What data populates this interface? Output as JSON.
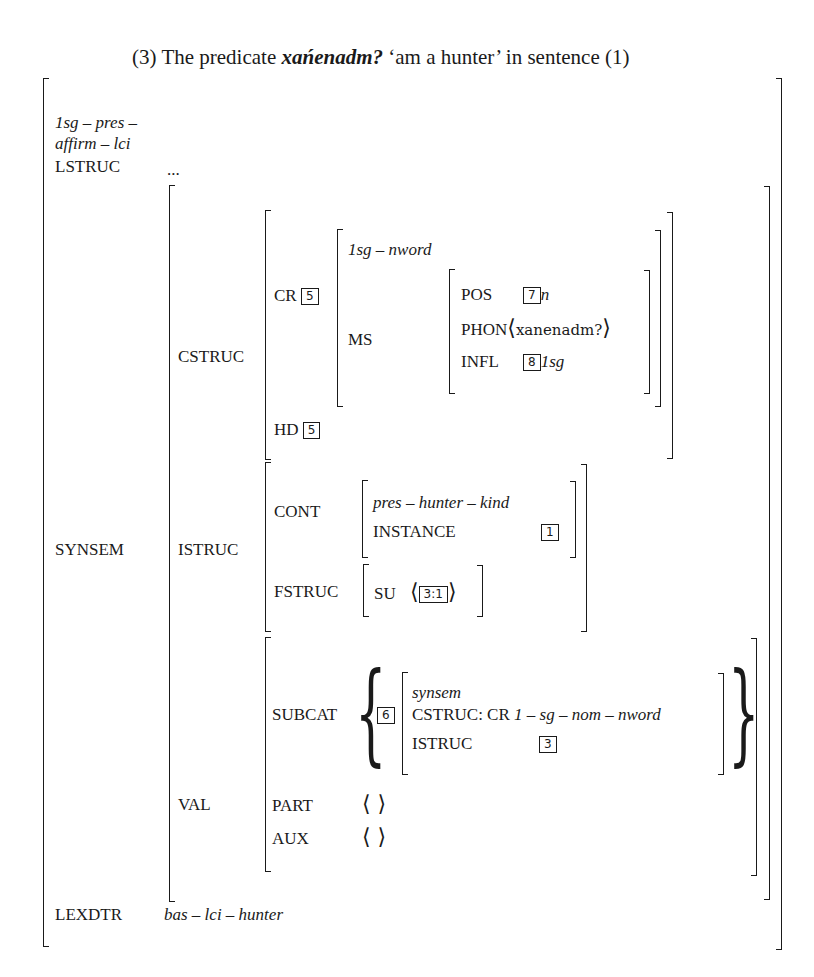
{
  "caption": {
    "number": "(3)",
    "prefix": "The predicate",
    "word": "xańenadm?",
    "gloss": "‘am a hunter’",
    "suffix": "in sentence (1)"
  },
  "avm": {
    "type_line1": "1sg – pres –",
    "type_line2": "affirm – lci",
    "lstruc": {
      "label": "LSTRUC",
      "value": "..."
    },
    "synsem": {
      "label": "SYNSEM",
      "cstruc": {
        "label": "CSTRUC",
        "cr": {
          "label": "CR",
          "tag": "5",
          "type": "1sg – nword",
          "ms": {
            "label": "MS",
            "pos": {
              "label": "POS",
              "tag": "7",
              "value": "n"
            },
            "phon": {
              "label": "PHON",
              "value": "xanenadm?"
            },
            "infl": {
              "label": "INFL",
              "tag": "8",
              "value": "1sg"
            }
          }
        },
        "hd": {
          "label": "HD",
          "tag": "5"
        }
      },
      "istruc": {
        "label": "ISTRUC",
        "cont": {
          "label": "CONT",
          "type": "pres – hunter – kind",
          "instance_label": "INSTANCE",
          "instance_tag": "1"
        },
        "fstruc": {
          "label": "FSTRUC",
          "su_label": "SU",
          "su_tag": "3:1"
        }
      },
      "val": {
        "label": "VAL",
        "subcat": {
          "label": "SUBCAT",
          "tag": "6",
          "type": "synsem",
          "cstruc_label": "CSTRUC: CR",
          "cstruc_value": "1 – sg – nom – nword",
          "istruc_label": "ISTRUC",
          "istruc_tag": "3"
        },
        "part": {
          "label": "PART",
          "value": "⟨ ⟩"
        },
        "aux": {
          "label": "AUX",
          "value": "⟨ ⟩"
        }
      }
    },
    "lexdtr": {
      "label": "LEXDTR",
      "value": "bas – lci – hunter"
    }
  }
}
